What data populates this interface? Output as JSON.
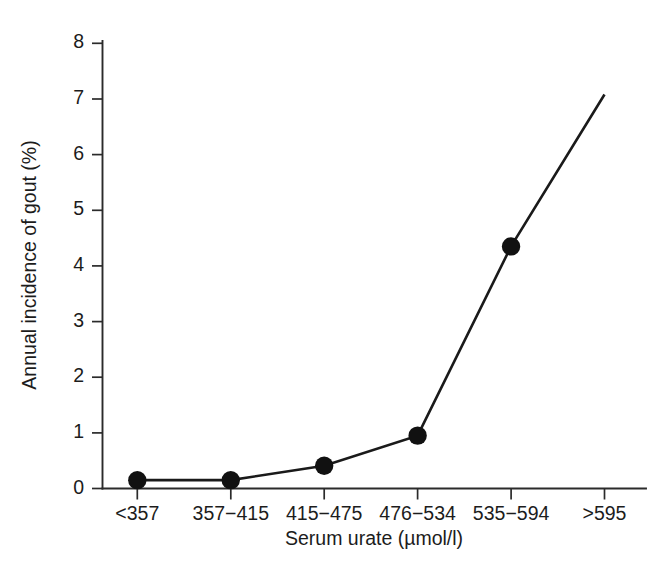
{
  "chart_data": {
    "type": "line",
    "title": "",
    "subtitle": "",
    "xlabel": "Serum urate (µmol/l)",
    "ylabel": "Annual incidence of gout (%)",
    "categories": [
      "<357",
      "357−415",
      "415−475",
      "476−534",
      "535−594",
      ">595"
    ],
    "values": [
      0.15,
      0.15,
      0.41,
      0.95,
      4.35,
      7.08
    ],
    "marker_shown": [
      true,
      true,
      true,
      true,
      true,
      false
    ],
    "series": [
      {
        "name": "Annual incidence of gout",
        "values": [
          0.15,
          0.15,
          0.41,
          0.95,
          4.35,
          7.08
        ]
      }
    ],
    "ylim": [
      0,
      8.35
    ],
    "ytick_labels": [
      "0",
      "1",
      "2",
      "3",
      "4",
      "5",
      "6",
      "7",
      "8"
    ],
    "ytick_values": [
      0,
      1,
      2,
      3,
      4,
      5,
      6,
      7,
      8
    ],
    "grid": false,
    "legend": false,
    "legend_position": "none",
    "line_color": "#1a1a1a",
    "marker_color": "#111111",
    "axis_color": "#2b2b2b",
    "background_color": "#ffffff",
    "annotations": []
  }
}
